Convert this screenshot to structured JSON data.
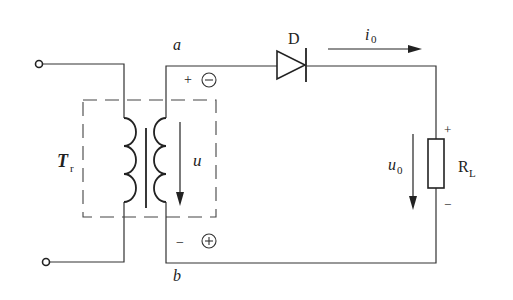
{
  "diagram": {
    "type": "half-wave rectifier circuit",
    "labels": {
      "transformer": "T",
      "transformer_sub": "r",
      "node_a": "a",
      "node_b": "b",
      "diode": "D",
      "current": "i",
      "current_sub": "0",
      "secondary_voltage": "u",
      "output_voltage": "u",
      "output_voltage_sub": "0",
      "load": "R",
      "load_sub": "L",
      "plus_top": "+",
      "minus_bottom": "−",
      "load_plus": "+",
      "load_minus": "−",
      "circled_minus": "−",
      "circled_plus": "+"
    },
    "colors": {
      "line": "#333333",
      "background": "#ffffff"
    }
  }
}
